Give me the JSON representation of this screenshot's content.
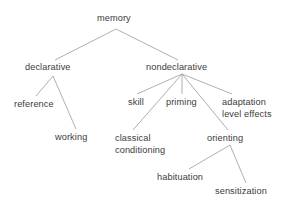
{
  "diagram": {
    "type": "tree",
    "title": "memory",
    "background_color": "#ffffff",
    "text_color": "#3b3b3b",
    "edge_color": "#9a9a9a",
    "width": 289,
    "height": 205,
    "nodes": [
      {
        "id": "memory",
        "label": "memory",
        "x": 97,
        "y": 13,
        "anchor": 116
      },
      {
        "id": "declarative",
        "label": "declarative",
        "x": 25,
        "y": 62,
        "anchor": 53
      },
      {
        "id": "nondeclarative",
        "label": "nondeclarative",
        "x": 146,
        "y": 62,
        "anchor": 182
      },
      {
        "id": "reference",
        "label": "reference",
        "x": 14,
        "y": 99,
        "anchor": 37
      },
      {
        "id": "working",
        "label": "working",
        "x": 55,
        "y": 132,
        "anchor": 76
      },
      {
        "id": "skill",
        "label": "skill",
        "x": 128,
        "y": 97,
        "anchor": 138
      },
      {
        "id": "priming",
        "label": "priming",
        "x": 166,
        "y": 97,
        "anchor": 182
      },
      {
        "id": "adaptation",
        "label": "adaptation",
        "x": 222,
        "y": 97,
        "anchor": 243
      },
      {
        "id": "level-effects",
        "label": "level effects",
        "x": 222,
        "y": 109,
        "anchor": 243
      },
      {
        "id": "classical",
        "label": "classical",
        "x": 115,
        "y": 133,
        "anchor": 134
      },
      {
        "id": "conditioning",
        "label": "conditioning",
        "x": 115,
        "y": 145,
        "anchor": 134
      },
      {
        "id": "orienting",
        "label": "orienting",
        "x": 207,
        "y": 133,
        "anchor": 229
      },
      {
        "id": "habituation",
        "label": "habituation",
        "x": 157,
        "y": 172,
        "anchor": 188
      },
      {
        "id": "sensitization",
        "label": "sensitization",
        "x": 215,
        "y": 186,
        "anchor": 245
      }
    ],
    "edges": [
      {
        "from": "memory",
        "to": "declarative",
        "x1": 116,
        "y1": 29,
        "x2": 55,
        "y2": 60
      },
      {
        "from": "memory",
        "to": "nondeclarative",
        "x1": 116,
        "y1": 29,
        "x2": 178,
        "y2": 60
      },
      {
        "from": "declarative",
        "to": "reference",
        "x1": 53,
        "y1": 76,
        "x2": 36,
        "y2": 96
      },
      {
        "from": "declarative",
        "to": "working",
        "x1": 53,
        "y1": 76,
        "x2": 76,
        "y2": 129
      },
      {
        "from": "nondeclarative",
        "to": "skill",
        "x1": 182,
        "y1": 74,
        "x2": 137,
        "y2": 94
      },
      {
        "from": "nondeclarative",
        "to": "priming",
        "x1": 182,
        "y1": 74,
        "x2": 182,
        "y2": 94
      },
      {
        "from": "nondeclarative",
        "to": "adaptation",
        "x1": 182,
        "y1": 74,
        "x2": 232,
        "y2": 94
      },
      {
        "from": "nondeclarative",
        "to": "classical",
        "x1": 182,
        "y1": 74,
        "x2": 133,
        "y2": 130
      },
      {
        "from": "nondeclarative",
        "to": "orienting",
        "x1": 182,
        "y1": 74,
        "x2": 228,
        "y2": 130
      },
      {
        "from": "orienting",
        "to": "habituation",
        "x1": 230,
        "y1": 145,
        "x2": 189,
        "y2": 169
      },
      {
        "from": "orienting",
        "to": "sensitization",
        "x1": 230,
        "y1": 145,
        "x2": 246,
        "y2": 183
      }
    ]
  }
}
